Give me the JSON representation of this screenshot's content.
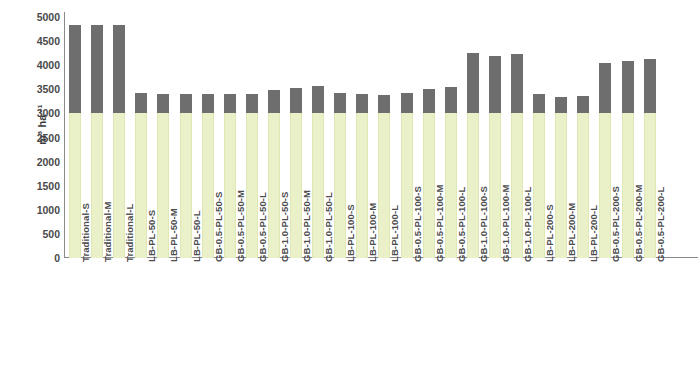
{
  "chart_data": {
    "type": "bar",
    "title": "",
    "subtitle": "",
    "xlabel": "",
    "ylabel": "m³ ha⁻¹",
    "ylim": [
      0,
      5000
    ],
    "ytick_values": [
      0,
      500,
      1000,
      1500,
      2000,
      2500,
      3000,
      3500,
      4000,
      4500,
      5000
    ],
    "ytick_labels": [
      "0",
      "500",
      "1000",
      "1500",
      "2000",
      "2500",
      "3000",
      "3500",
      "4000",
      "4500",
      "5000"
    ],
    "grid": false,
    "legend": "none",
    "stacked": true,
    "categories": [
      "Traditional-S",
      "Traditional-M",
      "Traditional-L",
      "LB-PL-50-S",
      "LB-PL-50-M",
      "LB-PL-50-L",
      "GB-0.5-PL-50-S",
      "GB-0.5-PL-50-M",
      "GB-0.5-PL-50-L",
      "GB-1.0-PL-50-S",
      "GB-1.0-PL-50-M",
      "GB-1.0-PL-50-L",
      "LB-PL-100-S",
      "LB-PL-100-M",
      "LB-PL-100-L",
      "GB-0.5-PL-100-S",
      "GB-0.5-PL-100-M",
      "GB-0.5-PL-100-L",
      "GB-1.0-PL-100-S",
      "GB-1.0-PL-100-M",
      "GB-1.0-PL-100-L",
      "LB-PL-200-S",
      "LB-PL-200-M",
      "LB-PL-200-L",
      "GB-0.5-PL-200-S",
      "GB-0.5-PL-200-M",
      "GB-0.5-PL-200-L"
    ],
    "series": [
      {
        "name": "lower-segment",
        "color": "#eaf0c8",
        "values": [
          3000,
          3000,
          3000,
          3000,
          3000,
          3000,
          3000,
          3000,
          3000,
          3000,
          3000,
          3000,
          3000,
          3000,
          3000,
          3000,
          3000,
          3000,
          3000,
          3000,
          3000,
          3000,
          3000,
          3000,
          3000,
          3000,
          3000
        ]
      },
      {
        "name": "upper-segment",
        "color": "#6e6e6e",
        "values": [
          1830,
          1840,
          1830,
          420,
          400,
          400,
          400,
          400,
          400,
          480,
          520,
          560,
          420,
          400,
          380,
          430,
          500,
          540,
          1250,
          1200,
          1240,
          400,
          350,
          360,
          1040,
          1080,
          1130
        ]
      }
    ],
    "totals": [
      4830,
      4840,
      4830,
      3420,
      3400,
      3400,
      3400,
      3400,
      3400,
      3480,
      3520,
      3560,
      3420,
      3400,
      3380,
      3430,
      3500,
      3540,
      4250,
      4200,
      4240,
      3400,
      3350,
      3360,
      4040,
      4080,
      4130
    ]
  }
}
